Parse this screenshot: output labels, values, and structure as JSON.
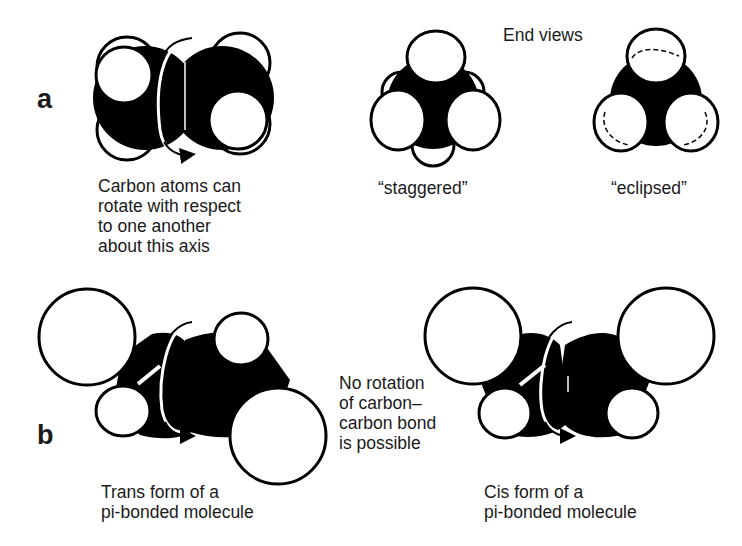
{
  "panels": {
    "a": {
      "label": "a",
      "side_view_caption": "Carbon atoms can\nrotate with respect\nto one another\nabout this axis",
      "end_views_title": "End views",
      "staggered_label": "“staggered”",
      "eclipsed_label": "“eclipsed”"
    },
    "b": {
      "label": "b",
      "trans_caption": "Trans form of a\npi-bonded molecule",
      "middle_caption": "No rotation\nof carbon–\ncarbon bond\nis possible",
      "cis_caption": "Cis form of a\npi-bonded molecule"
    }
  },
  "colors": {
    "carbon": "#000000",
    "hydrogen": "#ffffff",
    "outline": "#000000",
    "background": "#ffffff"
  }
}
